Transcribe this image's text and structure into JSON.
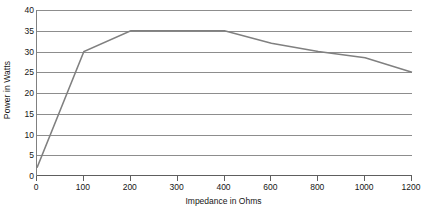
{
  "chart_data": {
    "type": "line",
    "title": "",
    "subtitle": "",
    "xlabel": "Impedance in Ohms",
    "ylabel": "Power in Watts",
    "categories": [
      "0",
      "100",
      "200",
      "300",
      "400",
      "600",
      "800",
      "1000",
      "1200"
    ],
    "values": [
      2,
      30,
      35,
      35,
      35,
      32,
      30,
      28.5,
      25
    ],
    "series": [
      {
        "name": "Power",
        "values": [
          2,
          30,
          35,
          35,
          35,
          32,
          30,
          28.5,
          25
        ]
      }
    ],
    "ylim": [
      0,
      40
    ],
    "y_ticks": [
      0,
      5,
      10,
      15,
      20,
      25,
      30,
      35,
      40
    ],
    "y_tick_labels": [
      "0",
      "5",
      "10",
      "15",
      "20",
      "25",
      "30",
      "35",
      "40"
    ],
    "x_tick_labels": [
      "0",
      "100",
      "200",
      "300",
      "400",
      "600",
      "800",
      "1000",
      "1200"
    ],
    "grid": true,
    "grid_axis": "y",
    "legend": false,
    "legend_position": "none",
    "markers": false,
    "line_color": "#808080",
    "grid_color": "#8d8d8d",
    "axis_color": "#5e5e5e",
    "background_color": "#ffffff",
    "annotations": []
  }
}
